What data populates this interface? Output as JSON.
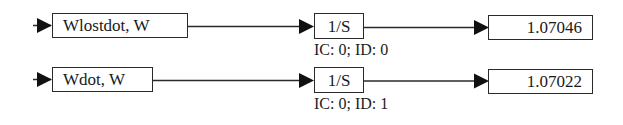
{
  "diagram": {
    "type": "block-diagram",
    "rows": [
      {
        "source": {
          "label": "Wlostdot, W"
        },
        "integrator": {
          "label": "1/S",
          "params": "IC: 0; ID: 0"
        },
        "display": {
          "value": "1.07046"
        }
      },
      {
        "source": {
          "label": "Wdot, W"
        },
        "integrator": {
          "label": "1/S",
          "params": "IC: 0; ID: 1"
        },
        "display": {
          "value": "1.07022"
        }
      }
    ],
    "colors": {
      "line": "#2a2a2a",
      "background": "#ffffff",
      "text": "#1a1a1a"
    }
  }
}
